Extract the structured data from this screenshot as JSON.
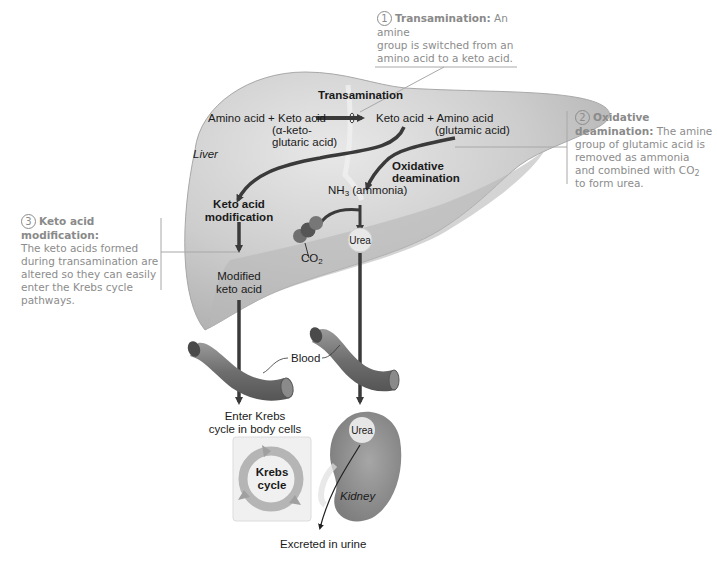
{
  "figure": {
    "organs": {
      "liver": "Liver",
      "kidney": "Kidney",
      "blood": "Blood"
    },
    "liver_labels": {
      "transamination": "Transamination",
      "reactants": "Amino acid + Keto acid",
      "reactant_note_1": "(α-keto-",
      "reactant_note_2": "glutaric acid)",
      "products": "Keto acid + Amino acid",
      "product_note": "(glutamic acid)",
      "oxidative_1": "Oxidative",
      "oxidative_2": "deamination",
      "nh3_prefix": "NH",
      "nh3_sub": "3",
      "nh3_suffix": " (ammonia)",
      "keto_mod_1": "Keto acid",
      "keto_mod_2": "modification",
      "co2_prefix": "CO",
      "co2_sub": "2",
      "urea": "Urea",
      "modified_1": "Modified",
      "modified_2": "keto acid"
    },
    "lower_labels": {
      "enter_krebs_1": "Enter Krebs",
      "enter_krebs_2": "cycle in body cells",
      "krebs_1": "Krebs",
      "krebs_2": "cycle",
      "kidney_urea": "Urea",
      "excreted": "Excreted in urine"
    },
    "callouts": [
      {
        "number": "1",
        "title": "Transamination:",
        "line1": " An amine",
        "line2": "group is switched from an",
        "line3": "amino acid to a keto acid."
      },
      {
        "number": "2",
        "title_1": "Oxidative",
        "title_2": "deamination:",
        "line1": " The amine",
        "line2": "group of glutamic acid is",
        "line3": "removed as ammonia",
        "line4_prefix": "and combined with CO",
        "line4_sub": "2",
        "line5": "to form urea."
      },
      {
        "number": "3",
        "title": "Keto acid modification:",
        "line1": "The keto acids formed",
        "line2": "during transamination are",
        "line3": "altered so they can easily",
        "line4": "enter the Krebs cycle",
        "line5": "pathways."
      }
    ],
    "colors": {
      "liver_fill": "#c9c9c9",
      "liver_shadow": "#b0b0b0",
      "arrow": "#3a3a3a",
      "callout_text": "#8c8c8c",
      "kidney_fill": "#8e8e8e",
      "urea_bubble": "#e6e6e6"
    }
  }
}
